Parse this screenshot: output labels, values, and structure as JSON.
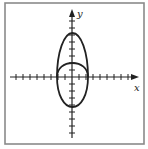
{
  "figure": {
    "type": "graph-of-curves-on-cartesian-axes",
    "frame": {
      "x": 5,
      "y": 3,
      "width": 139,
      "height": 141,
      "stroke": "#8a8a8a"
    },
    "axes": {
      "origin_px": [
        72,
        77
      ],
      "x_axis": {
        "label": "x",
        "from_px": 10,
        "to_px": 138,
        "arrow": "right",
        "label_pos": [
          136,
          90
        ]
      },
      "y_axis": {
        "label": "y",
        "from_px": 138,
        "to_px": 10,
        "arrow": "up",
        "label_pos": [
          77,
          16
        ]
      },
      "tick_spacing_px_approx": 7,
      "tick_spacing_note": "Approximate; tick positions read off a low-resolution image and may not be exactly uniform"
    },
    "curves": [
      {
        "name": "tall-closed-curve",
        "description": "Tall closed curve. Not symmetric about the x-axis: reaches about 44px above the origin but only about 30px below it.",
        "left_px": 57,
        "right_px": 88,
        "top_px": 33,
        "bottom_px": 107,
        "stroke": "#222"
      },
      {
        "name": "short-upper-arc",
        "description": "Short arc spanning the width of the tall curve, peaking near y=63px.",
        "left_px": 57,
        "right_px": 88,
        "peak_px": 63,
        "stroke": "#222"
      }
    ],
    "colors": {
      "line": "#222222",
      "frame": "#8a8a8a",
      "background": "#ffffff"
    }
  }
}
